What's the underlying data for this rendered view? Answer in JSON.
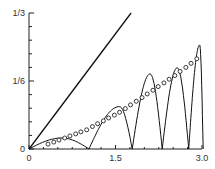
{
  "chart_data": {
    "type": "line",
    "title": "",
    "xlabel": "",
    "ylabel": "",
    "xlim": [
      0,
      3.0
    ],
    "ylim": [
      0,
      0.3333
    ],
    "grid": false,
    "legend": null,
    "x_ticks": [
      {
        "value": 0,
        "label": "0"
      },
      {
        "value": 1.5,
        "label": "1.5"
      },
      {
        "value": 3.0,
        "label": "3.0"
      }
    ],
    "x_minor_ticks": [
      0.25,
      0.5,
      0.75,
      1.0,
      1.25,
      1.75,
      2.0,
      2.25,
      2.5,
      2.75
    ],
    "y_ticks": [
      {
        "value": 0,
        "label": "0"
      },
      {
        "value": 0.16667,
        "label": "1/6"
      },
      {
        "value": 0.33333,
        "label": "1/3"
      }
    ],
    "y_minor_ticks": [
      0.0333,
      0.0667,
      0.1,
      0.1333,
      0.2,
      0.2333,
      0.2667,
      0.3
    ],
    "series": [
      {
        "name": "straight line",
        "style": "solid-line",
        "x": [
          0,
          1.77
        ],
        "y": [
          0,
          0.3333
        ]
      },
      {
        "name": "oscillating arches",
        "style": "solid-line",
        "arches": [
          {
            "x_start": 0.0,
            "x_end": 1.04,
            "peak_x": 0.57,
            "peak_y": 0.027
          },
          {
            "x_start": 1.04,
            "x_end": 1.79,
            "peak_x": 1.57,
            "peak_y": 0.104
          },
          {
            "x_start": 1.79,
            "x_end": 2.31,
            "peak_x": 2.1,
            "peak_y": 0.184
          },
          {
            "x_start": 2.31,
            "x_end": 2.77,
            "peak_x": 2.57,
            "peak_y": 0.199
          },
          {
            "x_start": 2.77,
            "x_end": 3.02,
            "peak_x": 2.96,
            "peak_y": 0.255
          }
        ]
      },
      {
        "name": "circles",
        "style": "open-circle-markers",
        "x": [
          0.33,
          0.43,
          0.52,
          0.62,
          0.71,
          0.81,
          0.9,
          1.0,
          1.1,
          1.19,
          1.29,
          1.38,
          1.48,
          1.57,
          1.67,
          1.76,
          1.86,
          1.96,
          2.05,
          2.15,
          2.24,
          2.34,
          2.43,
          2.53,
          2.62,
          2.72,
          2.81,
          2.91
        ],
        "y": [
          0.012,
          0.017,
          0.022,
          0.027,
          0.032,
          0.037,
          0.042,
          0.047,
          0.055,
          0.062,
          0.069,
          0.076,
          0.083,
          0.09,
          0.099,
          0.108,
          0.117,
          0.126,
          0.135,
          0.144,
          0.153,
          0.162,
          0.171,
          0.18,
          0.19,
          0.2,
          0.21,
          0.221
        ]
      }
    ]
  },
  "axes": {
    "x_labels": [
      "0",
      "1.5",
      "3.0"
    ],
    "y_labels": [
      "0",
      "1/6",
      "1/3"
    ]
  }
}
